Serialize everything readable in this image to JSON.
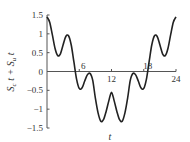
{
  "chart_data": {
    "type": "line",
    "title": "",
    "xlabel": "t",
    "ylabel": "S_c t + S_u t",
    "ylabel_parts": {
      "s1": "S",
      "sub1": "c",
      "t1": " t + ",
      "s2": "S",
      "sub2": "u",
      "t2": " t"
    },
    "xlim": [
      0,
      24
    ],
    "ylim": [
      -1.5,
      1.5
    ],
    "x_ticks": [
      6,
      12,
      18,
      24
    ],
    "x_tick_labels": [
      "6",
      "12",
      "18",
      "24"
    ],
    "y_ticks": [
      1.5,
      1,
      0.5,
      0,
      -0.5,
      -1,
      -1.5
    ],
    "y_tick_labels": [
      "1.5",
      "1",
      "0.5",
      "0",
      "−0.5",
      "−1",
      "−1.5"
    ],
    "grid": false,
    "legend": null,
    "series": [
      {
        "name": "S_c t + S_u t",
        "color": "#222222",
        "x": [
          0,
          0.5,
          1,
          1.5,
          2,
          2.5,
          3,
          3.5,
          4,
          4.5,
          5,
          5.5,
          6,
          6.5,
          7,
          7.5,
          8,
          8.5,
          9,
          9.5,
          10,
          10.5,
          11,
          11.5,
          12,
          12.5,
          13,
          13.5,
          14,
          14.5,
          15,
          15.5,
          16,
          16.5,
          17,
          17.5,
          18,
          18.5,
          19,
          19.5,
          20,
          20.5,
          21,
          21.5,
          22,
          22.5,
          23,
          23.5,
          24
        ],
        "values": [
          1.45,
          1.31,
          0.97,
          0.61,
          0.42,
          0.47,
          0.71,
          0.93,
          0.95,
          0.71,
          0.26,
          -0.2,
          -0.45,
          -0.44,
          -0.26,
          -0.09,
          -0.05,
          -0.23,
          -0.71,
          -1.1,
          -1.32,
          -1.28,
          -1.06,
          -0.78,
          -0.55,
          -0.78,
          -1.06,
          -1.28,
          -1.32,
          -1.1,
          -0.71,
          -0.23,
          -0.05,
          -0.09,
          -0.26,
          -0.44,
          -0.45,
          -0.2,
          0.26,
          0.71,
          0.95,
          0.93,
          0.71,
          0.47,
          0.42,
          0.61,
          0.97,
          1.31,
          1.45
        ]
      }
    ]
  }
}
